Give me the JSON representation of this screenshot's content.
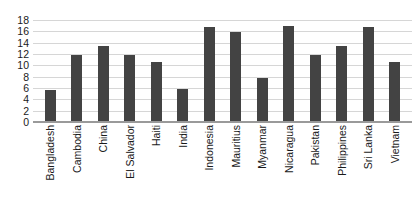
{
  "chart_data": {
    "type": "bar",
    "title": "",
    "subtitle": "",
    "xlabel": "",
    "ylabel": "",
    "ylim": [
      0,
      18
    ],
    "yticks": [
      18,
      16,
      14,
      12,
      10,
      8,
      6,
      4,
      2,
      0
    ],
    "grid": true,
    "legend": "none",
    "orientation": "vertical",
    "bar_color": "#434343",
    "gridline_color": "#d6d6d6",
    "axis_color": "#9a9a9a",
    "background_color": "#ffffff",
    "categories": [
      "Bangladesh",
      "Cambodia",
      "China",
      "El Salvador",
      "Haiti",
      "India",
      "Indonesia",
      "Mauritius",
      "Myanmar",
      "Nicaragua",
      "Pakistan",
      "Philippines",
      "Sri Lanka",
      "Vietnam"
    ],
    "values": [
      5.7,
      11.9,
      13.5,
      11.9,
      10.6,
      5.8,
      16.7,
      15.9,
      7.8,
      16.9,
      11.9,
      13.5,
      16.7,
      10.6
    ]
  }
}
